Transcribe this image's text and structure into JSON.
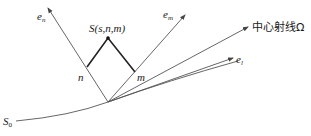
{
  "diagram": {
    "labels": {
      "e_n": "e",
      "e_n_sub": "n",
      "e_m": "e",
      "e_m_sub": "m",
      "e_l": "e",
      "e_l_sub": "l",
      "central_ray": "中心射线Ω",
      "point_S": "S(s,n,m)",
      "point_n": "n",
      "point_m": "m",
      "S0": "S",
      "S0_sub": "0"
    },
    "colors": {
      "line": "#555555",
      "bold_line": "#222222",
      "background": "#ffffff"
    }
  }
}
